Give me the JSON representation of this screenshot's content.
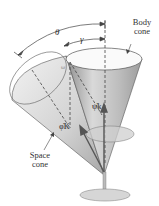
{
  "labels": {
    "body_cone": [
      "Body",
      "cone"
    ],
    "space_cone": [
      "Space",
      "cone"
    ],
    "theta": "θ",
    "gamma": "γ",
    "omega": "ω",
    "psi_dot_k": "ψ̇k",
    "phi_dot_k": "φ̇K"
  },
  "colors": {
    "cone_light": "#e8e8e8",
    "cone_mid": "#c9c9c9",
    "cone_dark": "#9a9a9a",
    "line": "#444444",
    "base": "#d8d8d8"
  }
}
